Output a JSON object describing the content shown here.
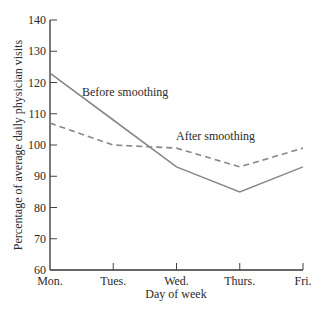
{
  "chart_data": {
    "type": "line",
    "title": "",
    "xlabel": "Day of week",
    "ylabel": "Percentage of average daily physician visits",
    "categories": [
      "Mon.",
      "Tues.",
      "Wed.",
      "Thurs.",
      "Fri."
    ],
    "series": [
      {
        "name": "Before smoothing",
        "style": "solid",
        "color": "#888888",
        "values": [
          123,
          108,
          93,
          85,
          93
        ]
      },
      {
        "name": "After smoothing",
        "style": "dashed",
        "color": "#888888",
        "values": [
          107,
          100,
          99,
          93,
          99
        ]
      }
    ],
    "ylim": [
      60,
      140
    ],
    "yticks": [
      60,
      70,
      80,
      90,
      100,
      110,
      120,
      130,
      140
    ],
    "grid": false,
    "legend": "inline annotations",
    "annotations": [
      {
        "text": "Before smoothing",
        "near": "Tues."
      },
      {
        "text": "After smoothing",
        "near": "Wed."
      }
    ]
  }
}
